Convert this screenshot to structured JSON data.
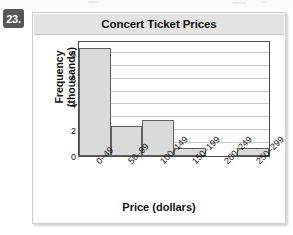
{
  "problem": {
    "number_label": "23."
  },
  "chart_data": {
    "type": "bar",
    "title": "Concert Ticket Prices",
    "xlabel": "Price (dollars)",
    "ylabel": "Frequency\n(thousands)",
    "ylabel_line1": "Frequency",
    "ylabel_line2": "(thousands)",
    "categories": [
      "0–49",
      "50–99",
      "100–149",
      "150–199",
      "200–249",
      "250–299"
    ],
    "values": [
      8.4,
      2.3,
      2.8,
      0.6,
      0,
      0.6
    ],
    "ylim": [
      0,
      9
    ],
    "ytick_labels": [
      "0",
      "2",
      "4",
      "6",
      "8"
    ],
    "ytick_values": [
      0,
      2,
      4,
      6,
      8
    ],
    "gridlines": [
      1,
      2,
      3,
      4,
      5,
      6,
      7,
      8,
      9
    ],
    "grid": true,
    "legend": "none",
    "bar_fill_color": "#dadada",
    "bar_edge_color": "#606060",
    "plot_border_color": "#4a4a4a",
    "gridline_color": "#c9c9c9",
    "title_bar_color": "#e3e3e3"
  }
}
